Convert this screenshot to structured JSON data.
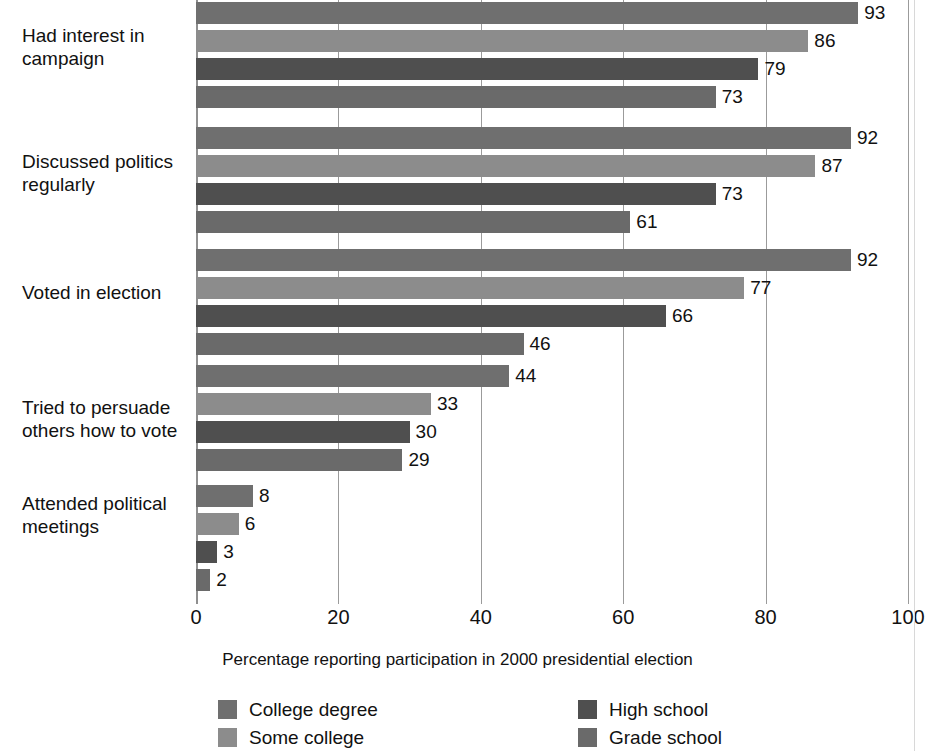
{
  "chart_data": {
    "type": "bar",
    "orientation": "horizontal",
    "title": "",
    "xlabel": "Percentage reporting participation in 2000 presidential election",
    "ylabel": "",
    "xlim": [
      0,
      100
    ],
    "xticks": [
      0,
      20,
      40,
      60,
      80,
      100
    ],
    "xtick_labels": [
      "0",
      "20",
      "40",
      "60",
      "80",
      "100"
    ],
    "grid": true,
    "legend_position": "bottom",
    "categories": [
      "Had interest in campaign",
      "Discussed politics regularly",
      "Voted in election",
      "Tried to persuade others how to vote",
      "Attended political meetings"
    ],
    "category_labels": [
      [
        "Had interest in",
        "campaign"
      ],
      [
        "Discussed politics",
        "regularly"
      ],
      [
        "Voted in election"
      ],
      [
        "Tried to persuade",
        "others how to vote"
      ],
      [
        "Attended political",
        "meetings"
      ]
    ],
    "series": [
      {
        "name": "College degree",
        "color": "#6f6f6f",
        "values": [
          93,
          92,
          92,
          44,
          8
        ]
      },
      {
        "name": "Some college",
        "color": "#8c8c8c",
        "values": [
          86,
          87,
          77,
          33,
          6
        ]
      },
      {
        "name": "High school",
        "color": "#4f4f4f",
        "values": [
          79,
          73,
          66,
          30,
          3
        ]
      },
      {
        "name": "Grade school",
        "color": "#6a6a6a",
        "values": [
          73,
          61,
          46,
          29,
          2
        ]
      }
    ],
    "data_labels": [
      [
        "93",
        "86",
        "79",
        "73"
      ],
      [
        "92",
        "87",
        "73",
        "61"
      ],
      [
        "92",
        "77",
        "66",
        "46"
      ],
      [
        "44",
        "33",
        "30",
        "29"
      ],
      [
        "8",
        "6",
        "3",
        "2"
      ]
    ]
  },
  "legend": {
    "items": [
      {
        "label": "College degree",
        "color": "#6f6f6f"
      },
      {
        "label": "Some college",
        "color": "#8c8c8c"
      },
      {
        "label": "High school",
        "color": "#4f4f4f"
      },
      {
        "label": "Grade school",
        "color": "#6a6a6a"
      }
    ]
  },
  "axis": {
    "caption": "Percentage reporting participation in 2000 presidential election",
    "ticks": [
      "0",
      "20",
      "40",
      "60",
      "80",
      "100"
    ]
  }
}
